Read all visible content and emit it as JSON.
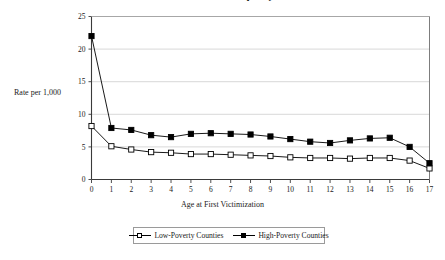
{
  "chart_data": {
    "type": "line",
    "title": "Victimization Frequency",
    "xlabel": "Age at First Victimization",
    "ylabel": "Rate per 1,000",
    "x": [
      0,
      1,
      2,
      3,
      4,
      5,
      6,
      7,
      8,
      9,
      10,
      11,
      12,
      13,
      14,
      15,
      16,
      17
    ],
    "categories": [
      "0",
      "1",
      "2",
      "3",
      "4",
      "5",
      "6",
      "7",
      "8",
      "9",
      "10",
      "11",
      "12",
      "13",
      "14",
      "15",
      "16",
      "17"
    ],
    "xlim": [
      0,
      17
    ],
    "ylim": [
      0,
      25
    ],
    "yticks": [
      0,
      5,
      10,
      15,
      20,
      25
    ],
    "xticks": [
      0,
      1,
      2,
      3,
      4,
      5,
      6,
      7,
      8,
      9,
      10,
      11,
      12,
      13,
      14,
      15,
      16,
      17
    ],
    "grid": "horizontal",
    "legend_position": "bottom",
    "series": [
      {
        "name": "Low-Poverty Counties",
        "marker": "open-square",
        "color": "#000000",
        "values": [
          8.2,
          5.1,
          4.6,
          4.2,
          4.1,
          3.9,
          3.9,
          3.8,
          3.7,
          3.6,
          3.4,
          3.3,
          3.3,
          3.2,
          3.3,
          3.3,
          2.9,
          1.7
        ]
      },
      {
        "name": "High-Poverty Counties",
        "marker": "filled-square",
        "color": "#000000",
        "values": [
          22.0,
          7.9,
          7.6,
          6.8,
          6.5,
          7.0,
          7.1,
          7.0,
          6.9,
          6.6,
          6.2,
          5.8,
          5.6,
          6.0,
          6.3,
          6.4,
          5.0,
          2.5
        ]
      }
    ]
  },
  "axes": {
    "y_title": "Rate per 1,000",
    "x_title": "Age at First Victimization"
  },
  "legend": {
    "entries": [
      {
        "label": "Low-Poverty Counties",
        "marker": "open-square"
      },
      {
        "label": "High-Poverty Counties",
        "marker": "filled-square"
      }
    ]
  }
}
